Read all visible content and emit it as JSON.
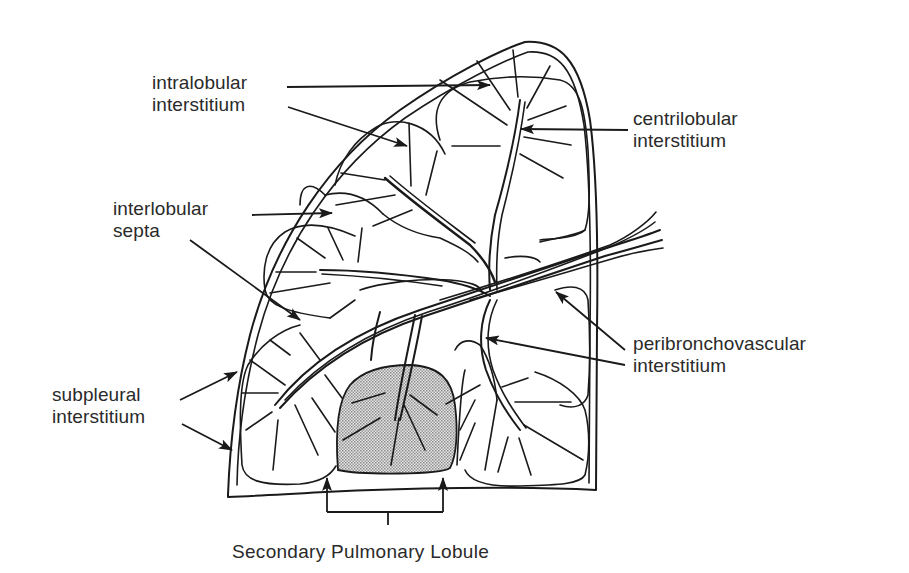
{
  "diagram": {
    "title": "Secondary Pulmonary Lobule",
    "labels": {
      "intralobular": [
        "intralobular",
        "interstitium"
      ],
      "centrilobular": [
        "centrilobular",
        "interstitium"
      ],
      "interlobular": [
        "interlobular",
        "septa"
      ],
      "peribronchovascular": [
        "peribronchovascular",
        "interstitium"
      ],
      "subpleural": [
        "subpleural",
        "interstitium"
      ]
    },
    "caption": "Secondary Pulmonary Lobule",
    "colors": {
      "line": "#1a1a1a",
      "text": "#2a2a2a",
      "highlight_fill": "#c8c8c8",
      "background": "#ffffff"
    },
    "highlighted_region": "one secondary pulmonary lobule (stippled)"
  }
}
